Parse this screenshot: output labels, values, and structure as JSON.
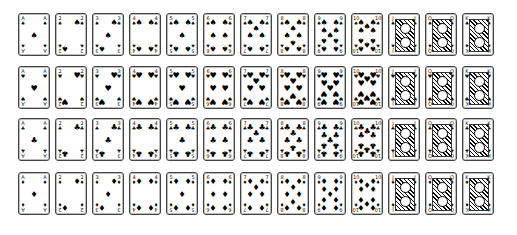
{
  "ranks": [
    "A",
    "2",
    "3",
    "4",
    "5",
    "6",
    "7",
    "8",
    "9",
    "10",
    "J",
    "Q",
    "K"
  ],
  "rows": [
    {
      "suit": "spades",
      "symbol": "♠",
      "top": 0
    },
    {
      "suit": "hearts",
      "symbol": "♥",
      "top": 53
    },
    {
      "suit": "clubs",
      "symbol": "♣",
      "top": 105
    },
    {
      "suit": "diamonds",
      "symbol": "♦",
      "top": 159
    }
  ],
  "column_spacing": 37,
  "card_count": 52
}
